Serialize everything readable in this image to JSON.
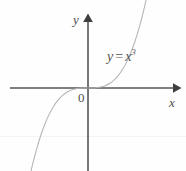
{
  "figure": {
    "kind": "cartesian-plot",
    "width": 186,
    "height": 171,
    "background_color": "#fefefe",
    "axis_color": "#555555",
    "curve_color": "#b4b4b4",
    "text_color": "#4a4a4a"
  },
  "labels": {
    "y_axis": "y",
    "x_axis": "x",
    "origin": "0",
    "equation_lhs": "y",
    "equation_operator": "=",
    "equation_base": "x",
    "equation_exponent": "3",
    "equation_full": "y = x³"
  },
  "chart_data": {
    "type": "line",
    "title": "",
    "subtitle": "",
    "xlabel": "x",
    "ylabel": "y",
    "legend": [],
    "legend_position": "none",
    "grid": false,
    "annotations": [
      {
        "text": "y = x³",
        "x": 1.35,
        "y": 2.0
      },
      {
        "text": "0",
        "x": -0.22,
        "y": -0.28
      }
    ],
    "axes": {
      "origin_px": [
        88,
        88
      ],
      "x_axis_px": {
        "x1": 10,
        "x2": 178,
        "y": 88,
        "arrow": "right"
      },
      "y_axis_px": {
        "y1": 15,
        "y2": 171,
        "x": 88,
        "arrow": "up"
      }
    },
    "xlim": [
      -2.05,
      2.1
    ],
    "ylim": [
      -2.4,
      2.25
    ],
    "series": [
      {
        "name": "y = x^3",
        "expression": "y = x^3",
        "x": [
          -1.9,
          -1.8,
          -1.7,
          -1.6,
          -1.5,
          -1.4,
          -1.3,
          -1.2,
          -1.1,
          -1.0,
          -0.9,
          -0.8,
          -0.7,
          -0.6,
          -0.5,
          -0.4,
          -0.3,
          -0.2,
          -0.1,
          0.0,
          0.1,
          0.2,
          0.3,
          0.4,
          0.5,
          0.6,
          0.7,
          0.8,
          0.9,
          1.0,
          1.1,
          1.2,
          1.3,
          1.4,
          1.5,
          1.6,
          1.7,
          1.8,
          1.9
        ],
        "y": [
          -6.859,
          -5.832,
          -4.913,
          -4.096,
          -3.375,
          -2.744,
          -2.197,
          -1.728,
          -1.331,
          -1.0,
          -0.729,
          -0.512,
          -0.343,
          -0.216,
          -0.125,
          -0.064,
          -0.027,
          -0.008,
          -0.001,
          0.0,
          0.001,
          0.008,
          0.027,
          0.064,
          0.125,
          0.216,
          0.343,
          0.512,
          0.729,
          1.0,
          1.331,
          1.728,
          2.197,
          2.744,
          3.375,
          4.096,
          4.913,
          5.832,
          6.859
        ]
      }
    ]
  }
}
